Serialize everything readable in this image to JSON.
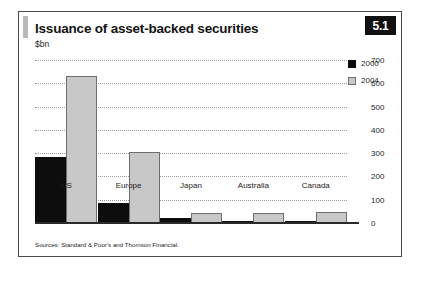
{
  "figure": {
    "title": "Issuance of asset-backed securities",
    "subtitle": "$bn",
    "badge": "5.1",
    "source": "Sources: Standard & Poor's and Thomson Financial."
  },
  "legend": {
    "position": "top-right",
    "items": [
      {
        "label": "2000",
        "color": "#0d0d0d",
        "swatch": "legend-swatch-2000"
      },
      {
        "label": "2004",
        "color": "#c8c8c8",
        "swatch": "legend-swatch-2004"
      }
    ]
  },
  "axis": {
    "ticks": [
      "0",
      "100",
      "200",
      "300",
      "400",
      "500",
      "600",
      "700"
    ]
  },
  "chart_data": {
    "type": "bar",
    "title": "Issuance of asset-backed securities",
    "subtitle": "$bn",
    "xlabel": "",
    "ylabel": "$bn",
    "ylim": [
      0,
      700
    ],
    "yticks": [
      0,
      100,
      200,
      300,
      400,
      500,
      600,
      700
    ],
    "grid": true,
    "legend_position": "top-right",
    "axis_side": "right",
    "categories": [
      "US",
      "Europe",
      "Japan",
      "Australia",
      "Canada"
    ],
    "series": [
      {
        "name": "2000",
        "color": "#0d0d0d",
        "values": [
          285,
          85,
          20,
          5,
          5
        ]
      },
      {
        "name": "2004",
        "color": "#c8c8c8",
        "values": [
          630,
          305,
          45,
          45,
          48
        ]
      }
    ],
    "source": "Sources: Standard & Poor's and Thomson Financial."
  }
}
